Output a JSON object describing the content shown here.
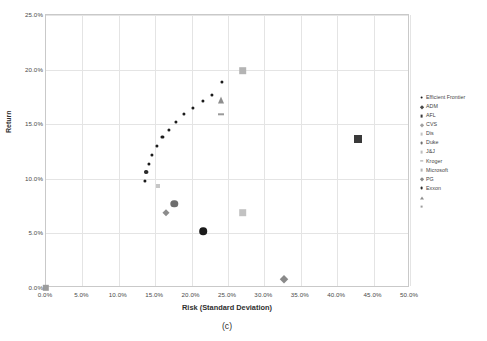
{
  "chart_data": {
    "type": "scatter",
    "title": "",
    "caption": "(c)",
    "xlabel": "Risk (Standard Deviation)",
    "ylabel": "Return",
    "xlim": [
      0,
      50
    ],
    "ylim": [
      0,
      25
    ],
    "xticks": [
      "0.0%",
      "5.0%",
      "10.0%",
      "15.0%",
      "20.0%",
      "25.0%",
      "30.0%",
      "35.0%",
      "40.0%",
      "45.0%",
      "50.0%"
    ],
    "xtick_values": [
      0,
      5,
      10,
      15,
      20,
      25,
      30,
      35,
      40,
      45,
      50
    ],
    "yticks": [
      "0.0%",
      "5.0%",
      "10.0%",
      "15.0%",
      "20.0%",
      "25.0%"
    ],
    "ytick_values": [
      0,
      5,
      10,
      15,
      20,
      25
    ],
    "grid": true,
    "legend_position": "right",
    "series": [
      {
        "name": "Efficient Frontier",
        "marker": "circle",
        "color": "#1b1b1b",
        "size": 3.1,
        "points": [
          {
            "x": 13.6,
            "y": 9.8
          },
          {
            "x": 13.8,
            "y": 10.6
          },
          {
            "x": 14.1,
            "y": 11.4
          },
          {
            "x": 14.6,
            "y": 12.2
          },
          {
            "x": 15.2,
            "y": 13.0
          },
          {
            "x": 16.0,
            "y": 13.8
          },
          {
            "x": 16.9,
            "y": 14.5
          },
          {
            "x": 17.9,
            "y": 15.2
          },
          {
            "x": 19.0,
            "y": 15.9
          },
          {
            "x": 20.2,
            "y": 16.5
          },
          {
            "x": 21.5,
            "y": 17.1
          },
          {
            "x": 22.8,
            "y": 17.7
          },
          {
            "x": 24.2,
            "y": 18.9
          }
        ]
      },
      {
        "name": "ADM",
        "marker": "circle",
        "color": "#1b1b1b",
        "size": 7.6,
        "points": [
          {
            "x": 21.6,
            "y": 5.2
          }
        ]
      },
      {
        "name": "AFL",
        "marker": "square",
        "color": "#3a3a3a",
        "size": 8.0,
        "points": [
          {
            "x": 42.8,
            "y": 13.6
          }
        ]
      },
      {
        "name": "CVS",
        "marker": "diamond",
        "color": "#8c8c8c",
        "size": 5.4,
        "points": [
          {
            "x": 16.5,
            "y": 6.9
          }
        ]
      },
      {
        "name": "Dis",
        "marker": "square",
        "color": "#c6c6c6",
        "size": 4.0,
        "points": [
          {
            "x": 15.4,
            "y": 9.3
          }
        ]
      },
      {
        "name": "Duke",
        "marker": "circle",
        "color": "#6e6e6e",
        "size": 7.4,
        "points": [
          {
            "x": 17.6,
            "y": 7.7
          }
        ]
      },
      {
        "name": "J&J",
        "marker": "square",
        "color": "#c2c2c2",
        "size": 7.6,
        "points": [
          {
            "x": 27.0,
            "y": 6.9
          }
        ]
      },
      {
        "name": "Kroger",
        "marker": "dash",
        "color": "#9a9a9a",
        "size": 6.0,
        "points": [
          {
            "x": 24.1,
            "y": 15.9
          }
        ]
      },
      {
        "name": "Microsoft",
        "marker": "square",
        "color": "#b4b4b4",
        "size": 7.6,
        "points": [
          {
            "x": 27.0,
            "y": 19.9
          }
        ]
      },
      {
        "name": "PG",
        "marker": "diamond",
        "color": "#8a8a8a",
        "size": 5.6,
        "points": [
          {
            "x": 32.7,
            "y": 0.8
          }
        ]
      },
      {
        "name": "Exxon",
        "marker": "circle",
        "color": "#2b2b2b",
        "size": 4.0,
        "points": [
          {
            "x": 13.8,
            "y": 10.6
          }
        ]
      },
      {
        "name": "",
        "marker": "triangle",
        "color": "#8e8e8e",
        "size": 7.0,
        "points": [
          {
            "x": 24.1,
            "y": 17.2
          }
        ]
      },
      {
        "name": " ",
        "marker": "square",
        "color": "#9c9c9c",
        "size": 6.4,
        "points": [
          {
            "x": 0.0,
            "y": 0.0
          }
        ]
      }
    ],
    "legend_entries": [
      {
        "label": "Efficient Frontier",
        "marker": "circle",
        "color": "#1b1b1b"
      },
      {
        "label": "ADM",
        "marker": "diamond",
        "color": "#4a4a4a"
      },
      {
        "label": "AFL",
        "marker": "square",
        "color": "#3a3a3a"
      },
      {
        "label": "CVS",
        "marker": "diamond",
        "color": "#a0a0a0"
      },
      {
        "label": "Dis",
        "marker": "square",
        "color": "#c2c2c2"
      },
      {
        "label": "Duke",
        "marker": "circle",
        "color": "#6e6e6e"
      },
      {
        "label": "J&J",
        "marker": "square",
        "color": "#bdbdbd"
      },
      {
        "label": "Kroger",
        "marker": "dash",
        "color": "#9a9a9a"
      },
      {
        "label": "Microsoft",
        "marker": "square",
        "color": "#b4b4b4"
      },
      {
        "label": "PG",
        "marker": "diamond",
        "color": "#8a8a8a"
      },
      {
        "label": "Exxon",
        "marker": "circle",
        "color": "#2b2b2b"
      },
      {
        "label": "",
        "marker": "triangle",
        "color": "#8e8e8e"
      },
      {
        "label": "",
        "marker": "square",
        "color": "#9c9c9c"
      }
    ]
  }
}
